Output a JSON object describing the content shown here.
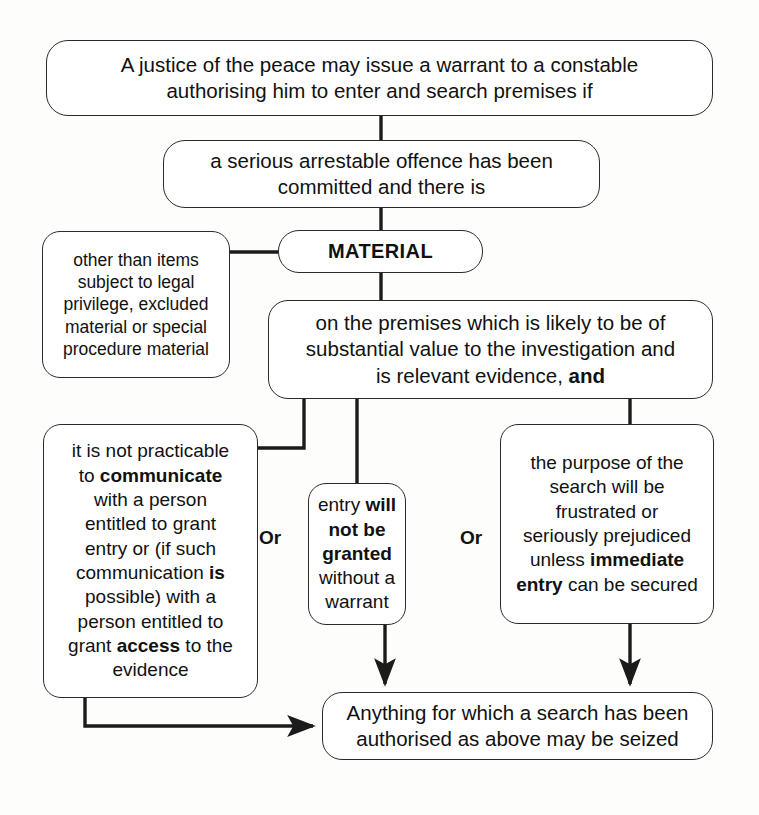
{
  "diagram": {
    "colors": {
      "stroke": "#2b2b2b",
      "fill": "#ffffff",
      "text": "#111111",
      "background": "#fdfdfc"
    },
    "connector_labels": {
      "or_left": "Or",
      "or_right": "Or"
    },
    "nodes": {
      "warrant": {
        "id": "warrant",
        "text": "A justice of the peace may issue a warrant to a constable authorising him to enter and search premises if",
        "lines": [
          "A justice of the peace may issue a warrant to a constable",
          "authorising him to enter and search premises if"
        ],
        "bold_fragments": []
      },
      "offence": {
        "id": "offence",
        "text": "a serious arrestable offence has been committed and there is",
        "lines": [
          "a serious arrestable offence has been",
          "committed and there is"
        ],
        "bold_fragments": []
      },
      "other_than": {
        "id": "other_than",
        "text": "other than items subject to legal privilege, excluded material or special procedure material",
        "lines": [
          "other than items",
          "subject to legal",
          "privilege, excluded",
          "material or special",
          "procedure material"
        ],
        "bold_fragments": []
      },
      "material": {
        "id": "material",
        "text": "MATERIAL",
        "lines": [
          "MATERIAL"
        ],
        "bold_fragments": [
          "MATERIAL"
        ]
      },
      "premises": {
        "id": "premises",
        "text": "on the premises which is likely to be of substantial value to the investigation and is relevant evidence, and",
        "lines": [
          "on the premises which is likely to be of",
          "substantial value to the investigation and",
          "is relevant evidence, and"
        ],
        "bold_fragments": [
          "and"
        ]
      },
      "practicable": {
        "id": "practicable",
        "text": "it is not practicable to communicate with a person entitled to grant entry or (if such communication is possible) with a person entitled to grant access to the evidence",
        "lines": [
          "it is not practicable",
          "to communicate",
          "with a person",
          "entitled to grant",
          "entry or (if such",
          "communication is",
          "possible) with a",
          "person entitled to",
          "grant access to the",
          "evidence"
        ],
        "bold_fragments": [
          "communicate",
          "is",
          "access"
        ]
      },
      "entry": {
        "id": "entry",
        "text": "entry will not be granted without a warrant",
        "lines": [
          "entry will",
          "not be",
          "granted",
          "without a",
          "warrant"
        ],
        "bold_fragments": [
          "will",
          "not be",
          "granted"
        ]
      },
      "purpose": {
        "id": "purpose",
        "text": "the purpose of the search will be frustrated or seriously prejudiced unless immediate entry can be secured",
        "lines": [
          "the purpose of the",
          "search will be",
          "frustrated or",
          "seriously prejudiced",
          "unless immediate",
          "entry can be secured"
        ],
        "bold_fragments": [
          "immediate",
          "entry"
        ]
      },
      "seized": {
        "id": "seized",
        "text": "Anything for which a search has been authorised as above may be seized",
        "lines": [
          "Anything for which a search has been",
          "authorised as above may be seized"
        ],
        "bold_fragments": []
      }
    }
  }
}
